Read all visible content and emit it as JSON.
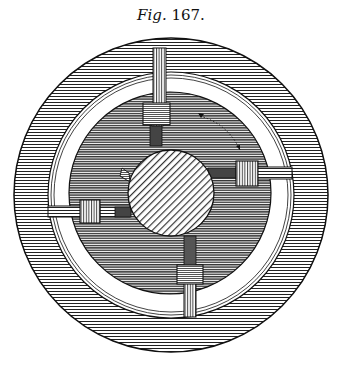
{
  "caption": {
    "prefix": "Fig.",
    "number": "167."
  },
  "figure": {
    "colors": {
      "ink": "#111111",
      "paper": "#ffffff",
      "outer_ring_hatch": "#2a2a2a",
      "dark_disk": "#3a3a3a",
      "hub_hatch": "#333333"
    },
    "center": [
      171,
      195
    ],
    "outer_radius": 157,
    "ring_inner_radius": 123,
    "dark_disk_radius": 101,
    "hub_center": [
      171,
      193
    ],
    "hub_radius": 43,
    "arms": [
      "top",
      "right",
      "bottom",
      "left"
    ],
    "rotation_arrow": "clockwise-dotted"
  }
}
